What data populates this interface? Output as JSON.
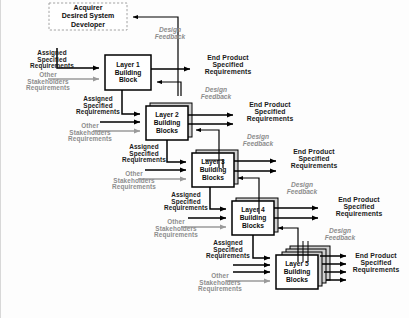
{
  "diagram": {
    "colors": {
      "assigned_text": "#1a1a1a",
      "other_text": "#8d8d8d",
      "feedback_text": "#8d8d8d",
      "box_stroke": "#000000",
      "box_fill": "#ffffff",
      "shadow_fill": "#d9d9d9",
      "gray_arrow": "#9a9a9a",
      "black_arrow": "#000000",
      "background": "#fdfdfd"
    },
    "acquirer": {
      "label": "Acquirer\nDesired System\nDeveloper",
      "style": "dashed"
    },
    "layers": [
      {
        "id": "layer1",
        "label": "Layer 1\nBuilding\nBlock",
        "stack": 1
      },
      {
        "id": "layer2",
        "label": "Layer 2\nBuilding\nBlocks",
        "stack": 2
      },
      {
        "id": "layer3",
        "label": "Layer 3\nBuilding\nBlocks",
        "stack": 2
      },
      {
        "id": "layer4",
        "label": "Layer 4\nBuilding\nBlocks",
        "stack": 2
      },
      {
        "id": "layer5",
        "label": "Layer 5\nBuilding\nBlocks",
        "stack": 4
      }
    ],
    "labels": {
      "assigned_specified_requirements": "Assigned\nSpecified\nRequirements",
      "other_stakeholders_requirements": "Other\nStakeholders\nRequirements",
      "end_product_specified_requirements": "End Product\nSpecified\nRequirements",
      "design_feedback": "Design\nFeedback"
    },
    "inputs": [
      {
        "for": "layer1",
        "assigned": "Assigned\nSpecified\nRequirements",
        "other": "Other\nStakeholders\nRequirements"
      },
      {
        "for": "layer2",
        "assigned": "Assigned\nSpecified\nRequirements",
        "other": "Other\nStakeholders\nRequirements"
      },
      {
        "for": "layer3",
        "assigned": "Assigned\nSpecified\nRequirements",
        "other": "Other\nStakeholders\nRequirements"
      },
      {
        "for": "layer4",
        "assigned": "Assigned\nSpecified\nRequirements",
        "other": "Other\nStakeholders\nRequirements"
      },
      {
        "for": "layer5",
        "assigned": "Assigned\nSpecified\nRequirements",
        "other": "Other\nStakeholders\nRequirements"
      }
    ],
    "outputs": [
      {
        "for": "layer1",
        "end_product": "End Product\nSpecified\nRequirements",
        "feedback": "Design\nFeedback"
      },
      {
        "for": "layer2",
        "end_product": "End Product\nSpecified\nRequirements",
        "feedback": "Design\nFeedback"
      },
      {
        "for": "layer3",
        "end_product": "End Product\nSpecified\nRequirements",
        "feedback": "Design\nFeedback"
      },
      {
        "for": "layer4",
        "end_product": "End Product\nSpecified\nRequirements",
        "feedback": "Design\nFeedback"
      },
      {
        "for": "layer5",
        "end_product": "End Product\nSpecified\nRequirements",
        "feedback": "Design\nFeedback"
      }
    ],
    "feedback_to_acquirer": "Design\nFeedback"
  }
}
